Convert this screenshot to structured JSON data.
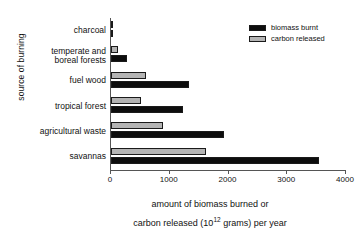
{
  "chart_data": {
    "type": "bar",
    "orientation": "horizontal",
    "title": "",
    "xlabel_line1": "amount of biomass burned or",
    "xlabel_line2_pre": "carbon released (10",
    "xlabel_exponent": "12",
    "xlabel_line2_post": " grams) per year",
    "ylabel": "source of burning",
    "categories": [
      "charcoal",
      "temperate and boreal forests",
      "fuel wood",
      "tropical forest",
      "agricultural waste",
      "savannas"
    ],
    "category_lines": [
      [
        "charcoal"
      ],
      [
        "temperate and",
        "boreal forests"
      ],
      [
        "fuel wood"
      ],
      [
        "tropical forest"
      ],
      [
        "agricultural waste"
      ],
      [
        "savannas"
      ]
    ],
    "series": [
      {
        "name": "biomass burnt",
        "color": "#0d0d0d",
        "values": [
          20,
          270,
          1330,
          1230,
          1930,
          3540
        ]
      },
      {
        "name": "carbon released",
        "color": "#b4b4b4",
        "values": [
          20,
          115,
          600,
          515,
          890,
          1620
        ]
      }
    ],
    "xlim": [
      0,
      4000
    ],
    "xticks": [
      0,
      1000,
      2000,
      3000,
      4000
    ],
    "xtick_labels": [
      "0",
      "1000",
      "2000",
      "3000",
      "4000"
    ],
    "grid": false,
    "legend_position": "top-right",
    "legend_entries": [
      "biomass burnt",
      "carbon released"
    ]
  }
}
